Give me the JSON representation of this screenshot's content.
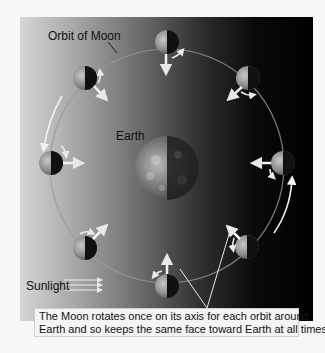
{
  "figure": {
    "labels": {
      "orbit": "Orbit of Moon",
      "earth": "Earth",
      "sunlight": "Sunlight"
    },
    "caption": {
      "line1": "The Moon rotates once on its axis for each orbit around",
      "line2": "Earth and so keeps the same face toward Earth at all times."
    },
    "moon_positions": [
      "top",
      "top-right",
      "right",
      "bottom-right",
      "bottom",
      "bottom-left",
      "left",
      "top-left"
    ],
    "colors": {
      "background_light": "#d6d6d6",
      "background_dark": "#000000",
      "orbit_line": "#9a9a9a",
      "arrow": "#f2f2f2",
      "caption_bg": "#f4f4f4"
    }
  }
}
